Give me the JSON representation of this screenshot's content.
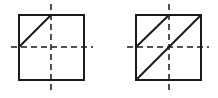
{
  "diagram": {
    "background": "#ffffff",
    "stroke_color": "#1a1a1a",
    "figures": [
      {
        "id": "left-square",
        "box": {
          "x": 19,
          "y": 15,
          "w": 65,
          "h": 65
        },
        "axes": {
          "vertical_x": 51,
          "vertical_y1": 4,
          "vertical_y2": 92,
          "horizontal_y": 47,
          "horizontal_x1": 11,
          "horizontal_x2": 93
        },
        "diagonals": [
          {
            "x1": 19,
            "y1": 47,
            "x2": 51,
            "y2": 15
          }
        ]
      },
      {
        "id": "right-square",
        "box": {
          "x": 136,
          "y": 15,
          "w": 65,
          "h": 65
        },
        "axes": {
          "vertical_x": 169,
          "vertical_y1": 4,
          "vertical_y2": 92,
          "horizontal_y": 47,
          "horizontal_x1": 127,
          "horizontal_x2": 209
        },
        "diagonals": [
          {
            "x1": 136,
            "y1": 47,
            "x2": 169,
            "y2": 15
          },
          {
            "x1": 136,
            "y1": 80,
            "x2": 201,
            "y2": 15
          }
        ]
      }
    ]
  }
}
